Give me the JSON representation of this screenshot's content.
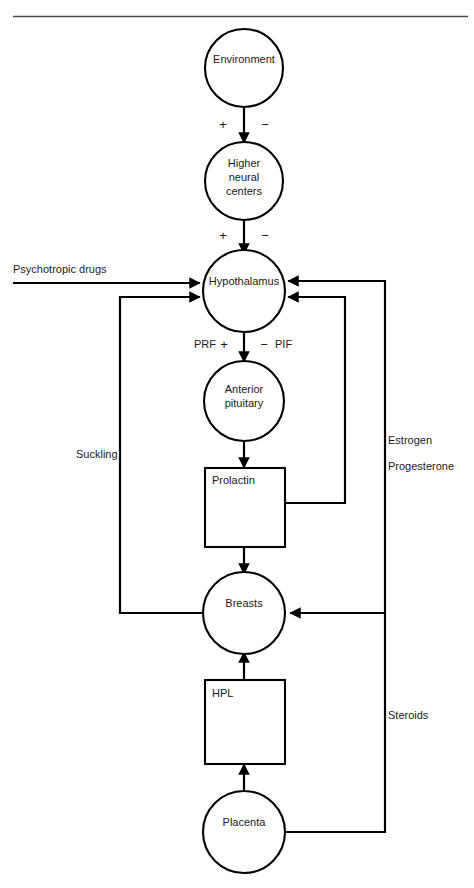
{
  "figure": {
    "type": "flow-diagram",
    "top_rule": true
  },
  "nodes": {
    "environment": {
      "label": "Environment",
      "shape": "circle"
    },
    "higher_neural_centers": {
      "label_line1": "Higher",
      "label_line2": "neural",
      "label_line3": "centers",
      "shape": "circle"
    },
    "hypothalamus": {
      "label": "Hypothalamus",
      "shape": "circle"
    },
    "anterior_pituitary": {
      "label_line1": "Anterior",
      "label_line2": "pituitary",
      "shape": "circle"
    },
    "prolactin": {
      "label": "Prolactin",
      "shape": "box"
    },
    "breasts": {
      "label": "Breasts",
      "shape": "circle"
    },
    "hpl": {
      "label": "HPL",
      "shape": "box"
    },
    "placenta": {
      "label": "Placenta",
      "shape": "circle"
    }
  },
  "edge_labels": {
    "psychotropic_drugs": "Psychotropic drugs",
    "suckling": "Suckling",
    "estrogen": "Estrogen",
    "progesterone": "Progesterone",
    "steroids": "Steroids",
    "prf": "PRF",
    "pif": "PIF"
  },
  "signs": {
    "env_to_hnc_plus": "+",
    "env_to_hnc_minus": "−",
    "hnc_to_hypo_plus": "+",
    "hnc_to_hypo_minus": "−",
    "prf_plus": "+",
    "pif_minus": "−"
  },
  "colors": {
    "stroke": "#000000",
    "text": "#1a1a1a",
    "background": "#ffffff",
    "rule": "#4a4a4a"
  }
}
